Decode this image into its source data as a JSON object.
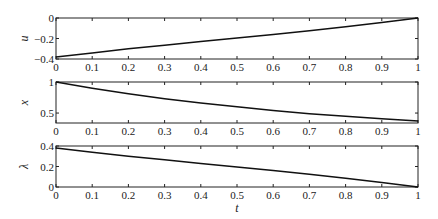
{
  "chart_data": [
    {
      "type": "line",
      "title": "",
      "xlabel": "",
      "ylabel": "u",
      "xlim": [
        0,
        1
      ],
      "ylim": [
        -0.4,
        0
      ],
      "xticks": [
        "0",
        "0.1",
        "0.2",
        "0.3",
        "0.4",
        "0.5",
        "0.6",
        "0.7",
        "0.8",
        "0.9",
        "1"
      ],
      "yticks": [
        "-0.4",
        "-0.2",
        "0"
      ],
      "grid": false,
      "series": [
        {
          "name": "u",
          "x": [
            0,
            0.1,
            0.2,
            0.3,
            0.4,
            0.5,
            0.6,
            0.7,
            0.8,
            0.9,
            1
          ],
          "values": [
            -0.38,
            -0.34,
            -0.3,
            -0.265,
            -0.23,
            -0.195,
            -0.16,
            -0.125,
            -0.085,
            -0.045,
            0
          ]
        }
      ]
    },
    {
      "type": "line",
      "title": "",
      "xlabel": "",
      "ylabel": "x",
      "xlim": [
        0,
        1
      ],
      "ylim": [
        0.34,
        1
      ],
      "xticks": [
        "0",
        "0.1",
        "0.2",
        "0.3",
        "0.4",
        "0.5",
        "0.6",
        "0.7",
        "0.8",
        "0.9",
        "1"
      ],
      "yticks": [
        "0.5",
        "1"
      ],
      "grid": false,
      "series": [
        {
          "name": "x",
          "x": [
            0,
            0.1,
            0.2,
            0.3,
            0.4,
            0.5,
            0.6,
            0.7,
            0.8,
            0.9,
            1
          ],
          "values": [
            1.0,
            0.9,
            0.81,
            0.73,
            0.66,
            0.6,
            0.54,
            0.49,
            0.45,
            0.41,
            0.37
          ]
        }
      ]
    },
    {
      "type": "line",
      "title": "",
      "xlabel": "t",
      "ylabel": "λ",
      "xlim": [
        0,
        1
      ],
      "ylim": [
        0,
        0.4
      ],
      "xticks": [
        "0",
        "0.1",
        "0.2",
        "0.3",
        "0.4",
        "0.5",
        "0.6",
        "0.7",
        "0.8",
        "0.9",
        "1"
      ],
      "yticks": [
        "0",
        "0.2",
        "0.4"
      ],
      "grid": false,
      "series": [
        {
          "name": "λ",
          "x": [
            0,
            0.1,
            0.2,
            0.3,
            0.4,
            0.5,
            0.6,
            0.7,
            0.8,
            0.9,
            1
          ],
          "values": [
            0.38,
            0.34,
            0.3,
            0.265,
            0.23,
            0.195,
            0.16,
            0.125,
            0.085,
            0.045,
            0
          ]
        }
      ]
    }
  ],
  "labels": {
    "panel1_ylabel": "u",
    "panel2_ylabel": "x",
    "panel3_ylabel": "λ",
    "xlabel": "t"
  }
}
